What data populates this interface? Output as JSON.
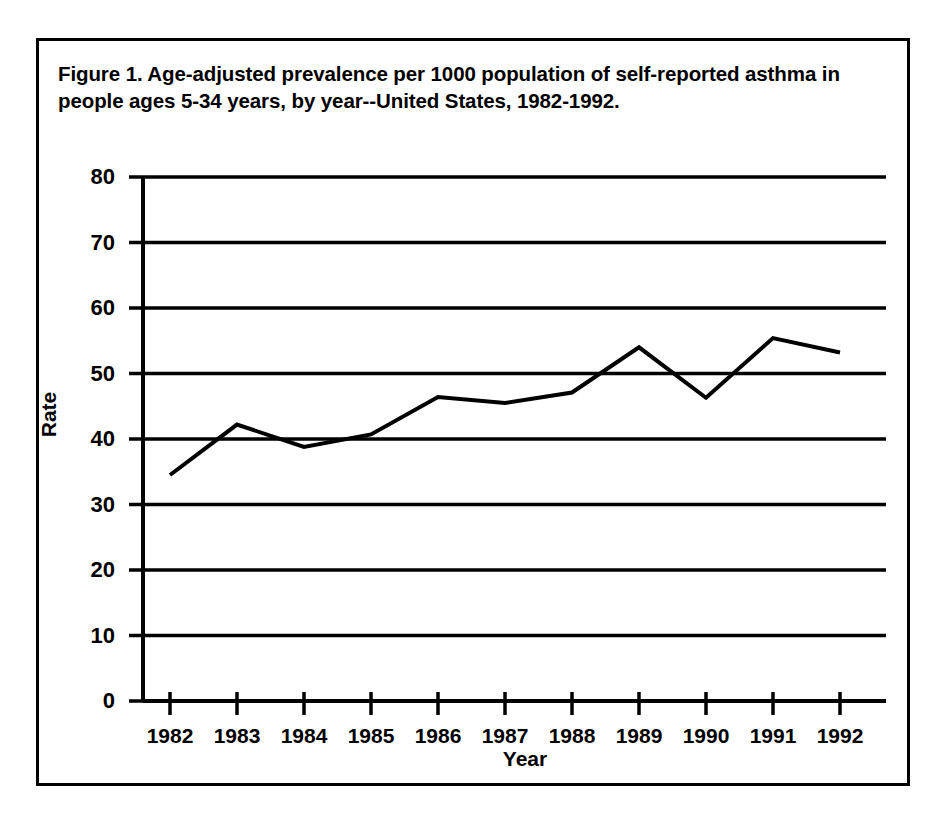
{
  "figure": {
    "caption": "Figure 1.  Age-adjusted prevalence per 1000 population of self-reported asthma in people ages 5-34 years, by year--United States, 1982-1992.",
    "frame_color": "#000000",
    "background_color": "#ffffff"
  },
  "chart_data": {
    "type": "line",
    "title": "Figure 1.  Age-adjusted prevalence per 1000 population of self-reported asthma in people ages 5-34 years, by year--United States, 1982-1992.",
    "xlabel": "Year",
    "ylabel": "Rate",
    "categories": [
      "1982",
      "1983",
      "1984",
      "1985",
      "1986",
      "1987",
      "1988",
      "1989",
      "1990",
      "1991",
      "1992"
    ],
    "x": [
      1982,
      1983,
      1984,
      1985,
      1986,
      1987,
      1988,
      1989,
      1990,
      1991,
      1992
    ],
    "values": [
      34.5,
      42.2,
      38.8,
      40.7,
      46.4,
      45.5,
      47.1,
      54.0,
      46.3,
      55.4,
      53.2
    ],
    "series": [
      {
        "name": "Age-adjusted prevalence per 1000 population",
        "values": [
          34.5,
          42.2,
          38.8,
          40.7,
          46.4,
          45.5,
          47.1,
          54.0,
          46.3,
          55.4,
          53.2
        ],
        "color": "#000000",
        "line_width": 4,
        "markers": "none"
      }
    ],
    "ylim": [
      0,
      80
    ],
    "yticks": [
      0,
      10,
      20,
      30,
      40,
      50,
      60,
      70,
      80
    ],
    "ytick_labels": [
      "0",
      "10",
      "20",
      "30",
      "40",
      "50",
      "60",
      "70",
      "80"
    ],
    "xtick_labels": [
      "1982",
      "1983",
      "1984",
      "1985",
      "1986",
      "1987",
      "1988",
      "1989",
      "1990",
      "1991",
      "1992"
    ],
    "grid": "horizontal",
    "grid_color": "#000000",
    "legend": "none",
    "legend_position": "none"
  },
  "axes": {
    "y_title": "Rate",
    "x_title": "Year",
    "y_tick_labels": [
      "80",
      "70",
      "60",
      "50",
      "40",
      "30",
      "20",
      "10",
      "0"
    ],
    "x_tick_labels": [
      "1982",
      "1983",
      "1984",
      "1985",
      "1986",
      "1987",
      "1988",
      "1989",
      "1990",
      "1991",
      "1992"
    ]
  }
}
